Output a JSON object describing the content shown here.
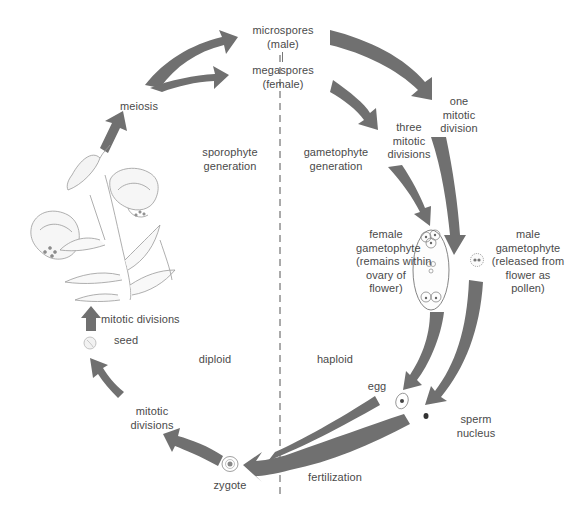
{
  "colors": {
    "arrow": "#707070",
    "text": "#4a4a4a",
    "divider": "#555555",
    "sketch": "#9a9a9a",
    "background": "#ffffff"
  },
  "labels": {
    "microspores": [
      "microspores",
      "(male)"
    ],
    "megaspores": [
      "megaspores",
      "(female)"
    ],
    "meiosis": "meiosis",
    "one_mitotic_division": [
      "one",
      "mitotic",
      "division"
    ],
    "three_mitotic_divisions": [
      "three",
      "mitotic",
      "divisions"
    ],
    "sporophyte_generation": [
      "sporophyte",
      "generation"
    ],
    "gametophyte_generation": [
      "gametophyte",
      "generation"
    ],
    "female_gametophyte": [
      "female",
      "gametophyte",
      "(remains within",
      "ovary of",
      "flower)"
    ],
    "male_gametophyte": [
      "male",
      "gametophyte",
      "(released from",
      "flower as",
      "pollen)"
    ],
    "mitotic_divisions_top": "mitotic divisions",
    "seed": "seed",
    "diploid": "diploid",
    "haploid": "haploid",
    "egg": "egg",
    "sperm_nucleus": [
      "sperm",
      "nucleus"
    ],
    "mitotic_divisions_bottom": [
      "mitotic",
      "divisions"
    ],
    "zygote": "zygote",
    "fertilization": "fertilization"
  },
  "illustrations": {
    "plant": "lily-flower-sketch",
    "female_gametophyte": "embryo-sac-ovule",
    "male_gametophyte": "pollen-grain",
    "egg": "egg-cell",
    "sperm": "sperm-nucleus-dot",
    "zygote": "zygote-cell",
    "seed": "seed-sketch"
  },
  "divider": {
    "style": "dashed",
    "separates": [
      "diploid",
      "haploid"
    ]
  }
}
